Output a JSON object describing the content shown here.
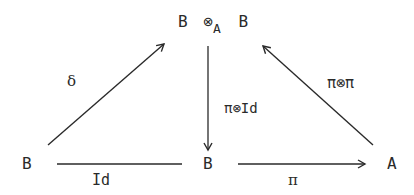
{
  "diagram": {
    "type": "commutative-diagram",
    "ink_color": "#2a2a2a",
    "nodes": {
      "top": {
        "left": "B",
        "op": "⊗",
        "subscript": "A",
        "right": "B"
      },
      "bottom_left": "B",
      "bottom_center": "B",
      "bottom_right": "A"
    },
    "edges": {
      "delta": {
        "label": "δ",
        "from": "bottom_left",
        "to": "top"
      },
      "pi_tensor_id": {
        "label": "π⊗Id",
        "from": "top",
        "to": "bottom_center"
      },
      "pi_tensor_pi": {
        "label": "π⊗π",
        "from": "bottom_right",
        "to": "top"
      },
      "id": {
        "label": "Id",
        "from": "bottom_left",
        "to": "bottom_center"
      },
      "pi": {
        "label": "π",
        "from": "bottom_center",
        "to": "bottom_right"
      }
    }
  }
}
